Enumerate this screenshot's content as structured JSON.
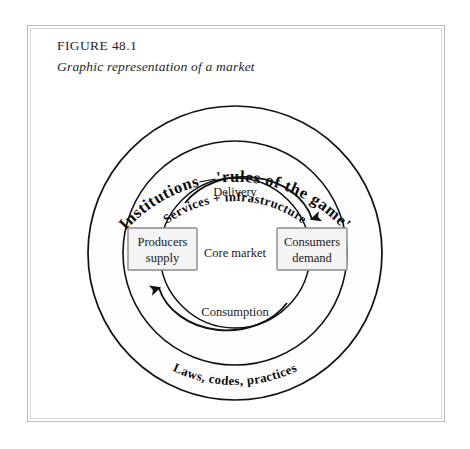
{
  "figure": {
    "number": "FIGURE 48.1",
    "subtitle": "Graphic representation of a market"
  },
  "diagram": {
    "rings": [
      {
        "name": "outer-ring",
        "label": "Institutions—'rules of the game'",
        "label_position": "top-arc",
        "weight": "bold"
      },
      {
        "name": "outer-ring",
        "label": "Laws, codes, practices",
        "label_position": "bottom-arc",
        "weight": "bold"
      },
      {
        "name": "middle-ring",
        "label": "Services + infrastructure",
        "label_position": "top-arc",
        "weight": "bold"
      },
      {
        "name": "inner-ring",
        "label": "Delivery",
        "label_position": "top-inside",
        "weight": "regular"
      },
      {
        "name": "inner-ring",
        "label": "Consumption",
        "label_position": "bottom-inside",
        "weight": "regular"
      }
    ],
    "center_label": "Core market",
    "boxes": [
      {
        "name": "producers-box",
        "line1": "Producers",
        "line2": "supply"
      },
      {
        "name": "consumers-box",
        "line1": "Consumers",
        "line2": "demand"
      }
    ],
    "flows": [
      {
        "name": "delivery-flow",
        "from": "Producers supply",
        "to": "Consumers demand",
        "label": "Delivery"
      },
      {
        "name": "consumption-flow",
        "from": "Consumers demand",
        "to": "Producers supply",
        "label": "Consumption"
      }
    ],
    "colors": {
      "stroke": "#111111",
      "box_fill": "#f4f4f4",
      "box_border": "#8a8a8a",
      "ring_fill": "#fdfdfd",
      "frame": "#b9b9b9",
      "text": "#1a1a1a"
    }
  }
}
